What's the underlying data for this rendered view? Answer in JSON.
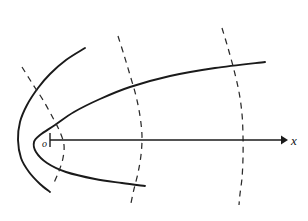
{
  "figure": {
    "background_color": "#ffffff",
    "width": 308,
    "height": 221,
    "origin_label": "o",
    "axis_label": "x"
  },
  "chart_data": {
    "type": "line",
    "xlabel": "x",
    "ylabel": "",
    "grid": false,
    "legend": "none",
    "axis_ranges": {
      "x_pixels": [
        18,
        286
      ],
      "y_pixels": [
        10,
        210
      ]
    },
    "annotations": [
      {
        "name": "origin-label",
        "text": "o",
        "x": 42,
        "y": 147
      },
      {
        "name": "axis-label",
        "text": "x",
        "x": 291,
        "y": 145
      }
    ],
    "axes": [
      {
        "name": "x-axis",
        "style": "solid",
        "arrow": "right-end",
        "start": [
          50,
          140
        ],
        "end": [
          285,
          140
        ],
        "tick_at_start": true
      }
    ],
    "series": [
      {
        "name": "outer-parabola",
        "style": "solid",
        "description": "outer rightward-opening parabola, vertex near x=18",
        "vertex": [
          18,
          140
        ],
        "points": [
          [
            85,
            48
          ],
          [
            66,
            60
          ],
          [
            50,
            74
          ],
          [
            38,
            88
          ],
          [
            27,
            105
          ],
          [
            20,
            122
          ],
          [
            18,
            140
          ],
          [
            21,
            158
          ],
          [
            29,
            172
          ],
          [
            40,
            184
          ],
          [
            50,
            192
          ]
        ]
      },
      {
        "name": "inner-parabola",
        "style": "solid",
        "description": "inner rightward-opening parabola, vertex near x=34, wide arms",
        "vertex": [
          34,
          140
        ],
        "points": [
          [
            265,
            62
          ],
          [
            215,
            68
          ],
          [
            170,
            76
          ],
          [
            130,
            87
          ],
          [
            100,
            99
          ],
          [
            74,
            112
          ],
          [
            55,
            125
          ],
          [
            40,
            135
          ],
          [
            34,
            142
          ],
          [
            36,
            152
          ],
          [
            47,
            163
          ],
          [
            66,
            172
          ],
          [
            95,
            179
          ],
          [
            122,
            183
          ],
          [
            145,
            186
          ]
        ]
      },
      {
        "name": "dashed-arc-left",
        "style": "dashed",
        "description": "leftmost dashed arc crossing the outer parabola",
        "points": [
          [
            22,
            67
          ],
          [
            32,
            83
          ],
          [
            43,
            100
          ],
          [
            53,
            118
          ],
          [
            60,
            132
          ],
          [
            64,
            145
          ],
          [
            63,
            158
          ],
          [
            59,
            171
          ],
          [
            53,
            185
          ]
        ]
      },
      {
        "name": "dashed-arc-middle",
        "style": "dashed",
        "description": "middle dashed arc crossing both solid curves",
        "points": [
          [
            118,
            36
          ],
          [
            124,
            55
          ],
          [
            130,
            75
          ],
          [
            136,
            96
          ],
          [
            140,
            116
          ],
          [
            142,
            136
          ],
          [
            141,
            155
          ],
          [
            138,
            173
          ],
          [
            134,
            189
          ],
          [
            131,
            203
          ]
        ]
      },
      {
        "name": "dashed-arc-right",
        "style": "dashed",
        "description": "rightmost dashed arc crossing the inner parabola upper arm",
        "points": [
          [
            222,
            28
          ],
          [
            228,
            48
          ],
          [
            234,
            70
          ],
          [
            239,
            92
          ],
          [
            242,
            114
          ],
          [
            243,
            136
          ],
          [
            243,
            158
          ],
          [
            242,
            178
          ],
          [
            240,
            194
          ],
          [
            239,
            205
          ]
        ]
      }
    ],
    "colors": {
      "solid_stroke": "#1a1a1a",
      "dashed_stroke": "#2b2b2b",
      "axis_stroke": "#1a1a1a",
      "text": "#111111",
      "background": "#ffffff"
    }
  }
}
